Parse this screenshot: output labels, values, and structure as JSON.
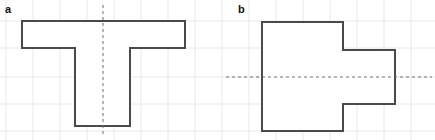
{
  "figure": {
    "width": 435,
    "height": 140,
    "background_color": "#ffffff",
    "grid": {
      "visible": true,
      "color": "#e8e8ea",
      "spacing_px": 27,
      "x_lines": [
        6,
        33,
        60,
        87,
        114,
        141,
        168,
        195,
        222,
        249,
        276,
        303,
        330,
        357,
        384,
        411
      ],
      "y_lines": [
        21,
        48,
        77,
        104,
        131
      ],
      "line_width": 1
    },
    "stroke_color": "#4a4a4a",
    "stroke_width": 2,
    "fill_color": "#ffffff",
    "axis_color": "#6b6b78",
    "axis_dash": "3,3"
  },
  "panels": [
    {
      "key": "a",
      "label": "a",
      "label_x": 5,
      "label_y": 4,
      "shape_name": "t-shape-polygon",
      "description": "T shaped polygon",
      "points": "22,21 185,21 185,48 130,48 130,126 75,126 75,48 22,48",
      "symmetry_axis": {
        "name": "vertical-dashed-symmetry-axis",
        "orientation": "vertical",
        "x1": 103,
        "y1": 5,
        "x2": 103,
        "y2": 137
      }
    },
    {
      "key": "b",
      "label": "b",
      "label_x": 238,
      "label_y": 4,
      "shape_name": "stepped-polygon",
      "description": "Stepped rectilinear polygon",
      "points": "262,22 343,22 343,50 395,50 395,104 343,104 343,131 262,131",
      "symmetry_axis": {
        "name": "horizontal-dashed-symmetry-axis",
        "orientation": "horizontal",
        "x1": 226,
        "y1": 77,
        "x2": 432,
        "y2": 77
      }
    }
  ]
}
